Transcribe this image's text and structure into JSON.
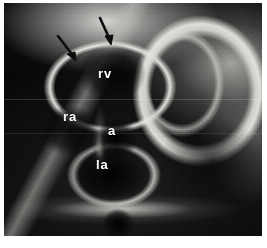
{
  "figure": {
    "kind": "grayscale-cardiac-tomographic-image",
    "modality_caption": "",
    "background_color": "#ffffff",
    "plate_color": "#0a0a0a"
  },
  "labels": [
    {
      "id": "rv",
      "text": "rv",
      "meaning": "right ventricle",
      "x": 98,
      "y": 70,
      "color": "#ffffff"
    },
    {
      "id": "ra",
      "text": "ra",
      "meaning": "right atrium",
      "x": 63,
      "y": 113,
      "color": "#ffffff"
    },
    {
      "id": "a",
      "text": "a",
      "meaning": "aorta",
      "x": 108,
      "y": 126,
      "color": "#ffffff"
    },
    {
      "id": "la",
      "text": "la",
      "meaning": "left atrium",
      "x": 96,
      "y": 160,
      "color": "#ffffff"
    }
  ],
  "arrows": [
    {
      "id": "arrow-left",
      "points_to": "curved-bright-structure",
      "x": 56,
      "y": 34,
      "size": 30,
      "angle_deg": 52,
      "color": "#111111"
    },
    {
      "id": "arrow-right",
      "points_to": "curved-bright-structure",
      "x": 96,
      "y": 16,
      "size": 30,
      "angle_deg": 78,
      "color": "#111111"
    }
  ],
  "scanlines": [
    {
      "id": "scanline-upper",
      "y": 96
    },
    {
      "id": "scanline-lower",
      "y": 130
    }
  ]
}
